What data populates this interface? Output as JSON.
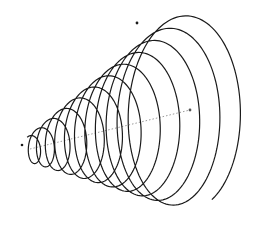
{
  "diagram": {
    "type": "3d-conical-spiral",
    "background": "#ffffff",
    "stroke_color": "#1a1a1a",
    "axis_color": "#9a9a9a",
    "axis": {
      "start": [
        30,
        149
      ],
      "end": [
        190,
        110
      ]
    },
    "helix": {
      "turns": 11.5,
      "start_radius_x": 7,
      "start_radius_y": 13,
      "end_radius_x": 54,
      "end_radius_y": 99,
      "samples": 1400,
      "tilt": 0.18
    },
    "endpoints": {
      "start_dot": [
        22,
        145
      ],
      "end_dot": [
        137,
        23
      ],
      "axis_dot": [
        190,
        110
      ]
    }
  }
}
